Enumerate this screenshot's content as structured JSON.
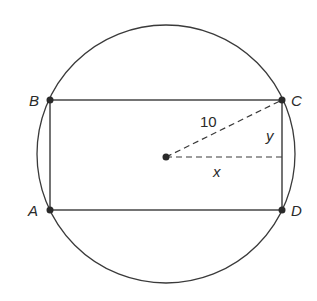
{
  "diagram": {
    "circle": {
      "cx": 166,
      "cy": 154,
      "r": 129
    },
    "center": {
      "x": 166,
      "y": 157
    },
    "vertices": [
      {
        "label": "A",
        "x": 50,
        "y": 210,
        "lx": 30,
        "ly": 216
      },
      {
        "label": "B",
        "x": 50,
        "y": 100,
        "lx": 30,
        "ly": 106
      },
      {
        "label": "C",
        "x": 282,
        "y": 100,
        "lx": 291,
        "ly": 106
      },
      {
        "label": "D",
        "x": 282,
        "y": 210,
        "lx": 291,
        "ly": 216
      }
    ],
    "labels": {
      "radius": "10",
      "vertical": "y",
      "horizontal": "x"
    },
    "colors": {
      "stroke": "#3a3a3a",
      "text": "#2a2a2a",
      "background": "#ffffff"
    }
  }
}
